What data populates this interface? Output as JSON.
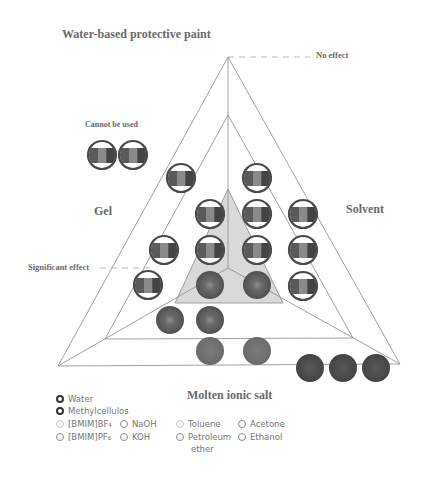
{
  "labels": {
    "title": "Water-based protective paint",
    "no_effect": "No effect",
    "cannot_be_used": "Cannot be used",
    "gel": "Gel",
    "solvent": "Solvent",
    "significant_effect": "Significant effect",
    "molten_ionic_salt": "Molten ionic salt"
  },
  "colors": {
    "line": "#8a8a8a",
    "gray_fill": "#d9d9d9",
    "ring": "#4a4a4a",
    "stripe_dark": "#5a5a5a",
    "stripe_mid": "#8a8a8a",
    "solid_dark": "#4d4d4d",
    "solid_mid": "#6e6e6e",
    "ring_center": "#8e8e8e",
    "text": "#6a6a6a"
  },
  "geometry": {
    "outer_triangle": [
      [
        228,
        57
      ],
      [
        58,
        366
      ],
      [
        400,
        364
      ]
    ],
    "middle_triangle": [
      [
        228,
        115
      ],
      [
        105,
        339
      ],
      [
        353,
        338
      ]
    ],
    "gray_triangle": [
      [
        228,
        189
      ],
      [
        175,
        303
      ],
      [
        283,
        303
      ]
    ],
    "center_point": [
      228,
      268
    ],
    "no_effect_dash": [
      [
        228,
        57
      ],
      [
        310,
        57
      ]
    ],
    "significant_dash": [
      [
        100,
        268
      ],
      [
        150,
        268
      ]
    ]
  },
  "samples": {
    "cannot_be_used": [
      {
        "x": 102,
        "y": 155,
        "style": "striped"
      },
      {
        "x": 133,
        "y": 155,
        "style": "striped"
      }
    ],
    "striped": [
      {
        "x": 181,
        "y": 178
      },
      {
        "x": 257,
        "y": 178
      },
      {
        "x": 210,
        "y": 214
      },
      {
        "x": 257,
        "y": 214
      },
      {
        "x": 303,
        "y": 214
      },
      {
        "x": 164,
        "y": 250
      },
      {
        "x": 210,
        "y": 250
      },
      {
        "x": 257,
        "y": 250
      },
      {
        "x": 303,
        "y": 250
      },
      {
        "x": 148,
        "y": 285
      },
      {
        "x": 303,
        "y": 286
      }
    ],
    "ringed_solid": [
      {
        "x": 210,
        "y": 285
      },
      {
        "x": 257,
        "y": 285
      },
      {
        "x": 170,
        "y": 320
      },
      {
        "x": 210,
        "y": 320
      }
    ],
    "solid_mid": [
      {
        "x": 210,
        "y": 351
      },
      {
        "x": 257,
        "y": 351
      }
    ],
    "solid_dark": [
      {
        "x": 310,
        "y": 368
      },
      {
        "x": 343,
        "y": 368
      },
      {
        "x": 376,
        "y": 368
      }
    ]
  },
  "legend": {
    "items": [
      {
        "label": "Water",
        "style": "dark",
        "x": 56,
        "y": 394
      },
      {
        "label": "Methylcellulos",
        "style": "dark",
        "x": 56,
        "y": 406
      },
      {
        "label": "[BMIM]BF₄",
        "style": "light",
        "x": 56,
        "y": 419
      },
      {
        "label": "NaOH",
        "style": "mid",
        "x": 120,
        "y": 419
      },
      {
        "label": "[BMIM]PF₆",
        "style": "mid",
        "x": 56,
        "y": 432
      },
      {
        "label": "KOH",
        "style": "mid",
        "x": 120,
        "y": 432
      },
      {
        "label": "Toluene",
        "style": "light",
        "x": 176,
        "y": 419
      },
      {
        "label": "Petroleum",
        "style": "mid",
        "x": 176,
        "y": 432
      },
      {
        "label": "Acetone",
        "style": "mid",
        "x": 238,
        "y": 419
      },
      {
        "label": "Ethanol",
        "style": "mid",
        "x": 238,
        "y": 432
      }
    ],
    "continuation": {
      "label": "ether",
      "x": 191,
      "y": 444
    }
  }
}
